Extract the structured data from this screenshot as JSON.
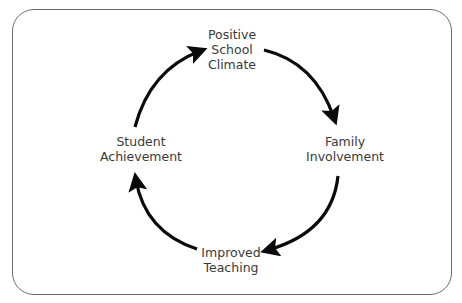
{
  "diagram": {
    "type": "cycle",
    "nodes": [
      {
        "id": "top",
        "label": "Positive\nSchool\nClimate"
      },
      {
        "id": "right",
        "label": "Family\nInvolvement"
      },
      {
        "id": "bottom",
        "label": "Improved\nTeaching"
      },
      {
        "id": "left",
        "label": "Student\nAchievement"
      }
    ],
    "edges": [
      {
        "from": "top",
        "to": "right"
      },
      {
        "from": "right",
        "to": "bottom"
      },
      {
        "from": "bottom",
        "to": "left"
      },
      {
        "from": "left",
        "to": "top"
      }
    ],
    "colors": {
      "arrow": "#0a0a0a",
      "text": "#3a3a3a",
      "border": "#6b6b6b"
    }
  }
}
